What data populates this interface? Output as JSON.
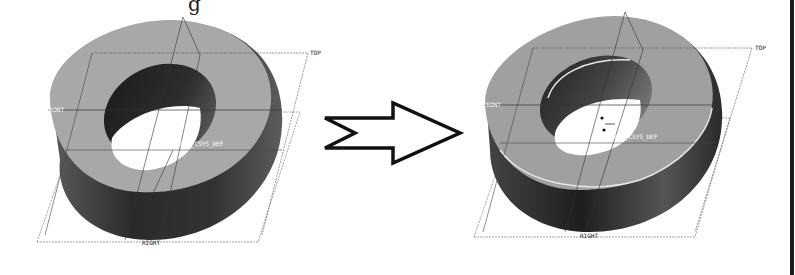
{
  "figure": {
    "top_caption_fragment": "g",
    "before": {
      "labels": {
        "top": "TOP",
        "front": "FRONT",
        "right": "RIGHT",
        "csys": "PRT_CSYS_DEF"
      }
    },
    "arrow": {
      "direction": "right",
      "icon": "right-arrow-icon"
    },
    "after": {
      "labels": {
        "top": "TOP",
        "front": "FRONT",
        "right": "RIGHT",
        "csys": "PRT_CSYS_DEF"
      }
    }
  }
}
